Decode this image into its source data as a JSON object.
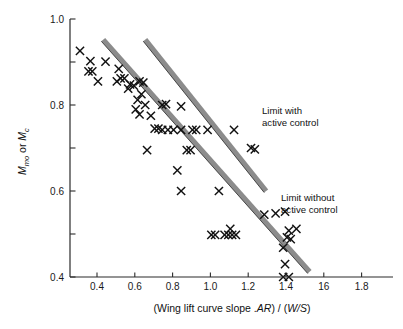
{
  "chart_data": {
    "type": "scatter",
    "title": "",
    "xlabel": "(Wing lift curve slope . AR) / (W/S)",
    "ylabel": "Mmo or Mc",
    "ylabel_parts": {
      "m1": "M",
      "sub1": "mo",
      "or": " or ",
      "m2": "M",
      "sub2": "c"
    },
    "xlabel_parts": {
      "p1": "(Wing lift curve slope .",
      "italic1": "AR",
      "p2": ") / (",
      "italic2": "W/S",
      "p3": ")"
    },
    "xlim": [
      0.22,
      1.92
    ],
    "ylim": [
      0.4,
      1.0
    ],
    "grid": false,
    "legend_position": "inline-annotations",
    "xticks": [
      0.4,
      0.6,
      0.8,
      1.0,
      1.2,
      1.4,
      1.6,
      1.8
    ],
    "xtick_labels": [
      "0.4",
      "0.6",
      "0.8",
      "1.0",
      "1.2",
      "1.4",
      "16",
      "1.8"
    ],
    "yticks": [
      0.4,
      0.6,
      0.8,
      1.0
    ],
    "ytick_labels": [
      "0.4",
      "0.6",
      "0.8",
      "1.0"
    ],
    "yticks_minor": [
      0.5,
      0.7,
      0.9
    ],
    "marker_symbol": "x",
    "series": [
      {
        "name": "aircraft data",
        "marker": "x",
        "points": [
          [
            0.31,
            0.926
          ],
          [
            0.365,
            0.902
          ],
          [
            0.445,
            0.901
          ],
          [
            0.355,
            0.878
          ],
          [
            0.375,
            0.878
          ],
          [
            0.515,
            0.884
          ],
          [
            0.405,
            0.855
          ],
          [
            0.525,
            0.862
          ],
          [
            0.545,
            0.862
          ],
          [
            0.505,
            0.855
          ],
          [
            0.575,
            0.848
          ],
          [
            0.595,
            0.845
          ],
          [
            0.625,
            0.855
          ],
          [
            0.645,
            0.852
          ],
          [
            0.565,
            0.838
          ],
          [
            0.635,
            0.825
          ],
          [
            0.615,
            0.812
          ],
          [
            0.655,
            0.8
          ],
          [
            0.605,
            0.79
          ],
          [
            0.625,
            0.778
          ],
          [
            0.685,
            0.775
          ],
          [
            0.745,
            0.8
          ],
          [
            0.765,
            0.802
          ],
          [
            0.845,
            0.797
          ],
          [
            0.705,
            0.745
          ],
          [
            0.725,
            0.745
          ],
          [
            0.745,
            0.742
          ],
          [
            0.775,
            0.742
          ],
          [
            0.805,
            0.742
          ],
          [
            0.845,
            0.742
          ],
          [
            0.905,
            0.742
          ],
          [
            0.925,
            0.742
          ],
          [
            0.985,
            0.742
          ],
          [
            1.125,
            0.742
          ],
          [
            0.665,
            0.695
          ],
          [
            0.875,
            0.695
          ],
          [
            0.895,
            0.695
          ],
          [
            1.215,
            0.7
          ],
          [
            1.235,
            0.697
          ],
          [
            0.825,
            0.648
          ],
          [
            0.845,
            0.6
          ],
          [
            1.045,
            0.6
          ],
          [
            1.285,
            0.545
          ],
          [
            1.345,
            0.548
          ],
          [
            1.395,
            0.552
          ],
          [
            1.005,
            0.498
          ],
          [
            1.025,
            0.498
          ],
          [
            1.075,
            0.498
          ],
          [
            1.095,
            0.498
          ],
          [
            1.115,
            0.498
          ],
          [
            1.105,
            0.512
          ],
          [
            1.135,
            0.498
          ],
          [
            1.415,
            0.508
          ],
          [
            1.455,
            0.512
          ],
          [
            1.405,
            0.492
          ],
          [
            1.425,
            0.488
          ],
          [
            1.385,
            0.468
          ],
          [
            1.395,
            0.43
          ],
          [
            1.385,
            0.4
          ],
          [
            1.415,
            0.4
          ]
        ]
      }
    ],
    "annotations": [
      {
        "id": "limit-with-active-control",
        "text_lines": [
          "Limit with",
          "active control"
        ],
        "line": {
          "x1": 0.655,
          "y1": 0.952,
          "x2": 1.295,
          "y2": 0.6
        }
      },
      {
        "id": "limit-without-active-control",
        "text_lines": [
          "Limit without",
          "active control"
        ],
        "line": {
          "x1": 0.433,
          "y1": 0.952,
          "x2": 1.525,
          "y2": 0.412
        }
      }
    ],
    "colors": {
      "marker": "#111111",
      "limit_band": "#8c8c8c",
      "limit_edge": "#3a3a3a",
      "axis": "#2b2b2b",
      "background": "#ffffff"
    }
  }
}
